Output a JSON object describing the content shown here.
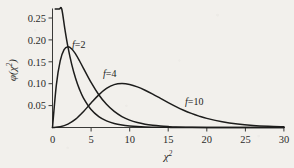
{
  "chart_data": {
    "type": "line",
    "title": "",
    "xlabel": "χ²",
    "xlabel_base": "χ",
    "xlabel_sup": "2",
    "ylabel": "φ(χ²)",
    "ylabel_base": "φ(χ",
    "ylabel_sup": "2",
    "ylabel_close": ")",
    "xlim": [
      0,
      30
    ],
    "ylim": [
      0,
      0.27
    ],
    "grid": false,
    "legend_position": "inline-annotations",
    "xticks": [
      0,
      5,
      10,
      15,
      20,
      25,
      30
    ],
    "xtick_labels": [
      "0",
      "5",
      "10",
      "15",
      "20",
      "25",
      "30"
    ],
    "yticks": [
      0.05,
      0.1,
      0.15,
      0.2,
      0.25
    ],
    "ytick_labels": [
      "0.05",
      "0.10",
      "0.15",
      "0.20",
      "0.25"
    ],
    "line_color": "#1d1d1c",
    "axis_color": "#3a3a38",
    "background_color": "#f2f0ec",
    "series": [
      {
        "name": "f=2",
        "label": "f=2",
        "label_var": "f",
        "label_rest": "=2",
        "df": 2,
        "peak_x": 0,
        "peak_y": 0.5,
        "x": [
          0.35,
          0.6,
          0.9,
          1.2,
          1.6,
          2,
          2.5,
          3,
          3.5,
          4,
          5,
          6,
          7,
          8,
          9,
          10,
          11,
          12,
          13,
          14,
          15,
          16,
          18,
          20,
          22,
          25,
          30
        ],
        "y": [
          0.4197,
          0.3704,
          0.3188,
          0.2744,
          0.2247,
          0.1839,
          0.1433,
          0.1116,
          0.0869,
          0.0677,
          0.041,
          0.0249,
          0.0151,
          0.0092,
          0.0056,
          0.0034,
          0.002,
          0.0012,
          0.0008,
          0.0005,
          0.0003,
          0.0002,
          0.0001,
          0.0,
          0.0,
          0.0,
          0.0
        ]
      },
      {
        "name": "f=4",
        "label": "f=4",
        "label_var": "f",
        "label_rest": "=4",
        "df": 4,
        "peak_x": 2,
        "peak_y": 0.1839,
        "x": [
          0,
          0.5,
          1,
          1.5,
          2,
          2.5,
          3,
          3.5,
          4,
          5,
          6,
          7,
          8,
          9,
          10,
          11,
          12,
          13,
          14,
          15,
          16,
          18,
          20,
          22,
          25,
          30
        ],
        "y": [
          0,
          0.0973,
          0.1516,
          0.1772,
          0.1839,
          0.179,
          0.1673,
          0.1521,
          0.1353,
          0.1026,
          0.0747,
          0.0528,
          0.0366,
          0.025,
          0.0168,
          0.0112,
          0.0074,
          0.0049,
          0.0032,
          0.0021,
          0.0013,
          0.0006,
          0.0002,
          0.0001,
          0.0,
          0.0
        ]
      },
      {
        "name": "f=10",
        "label": "f=10",
        "label_var": "f",
        "label_rest": "=10",
        "df": 10,
        "peak_x": 8,
        "peak_y": 0.0977,
        "x": [
          0,
          1,
          2,
          3,
          4,
          5,
          6,
          7,
          8,
          9,
          10,
          11,
          12,
          13,
          14,
          15,
          16,
          17,
          18,
          19,
          20,
          22,
          24,
          26,
          28,
          30
        ],
        "y": [
          0,
          0.0016,
          0.0077,
          0.0189,
          0.036,
          0.0558,
          0.0743,
          0.0889,
          0.0977,
          0.1,
          0.098,
          0.0926,
          0.0849,
          0.0759,
          0.0663,
          0.0567,
          0.0476,
          0.0394,
          0.0322,
          0.026,
          0.0208,
          0.013,
          0.0078,
          0.0046,
          0.0027,
          0.0015
        ]
      }
    ],
    "annotations": [
      {
        "text": "f=2",
        "x": 2.6,
        "y": 0.205
      },
      {
        "text": "f=4",
        "x": 6.6,
        "y": 0.137
      },
      {
        "text": "f=10",
        "x": 17.4,
        "y": 0.066
      }
    ]
  }
}
